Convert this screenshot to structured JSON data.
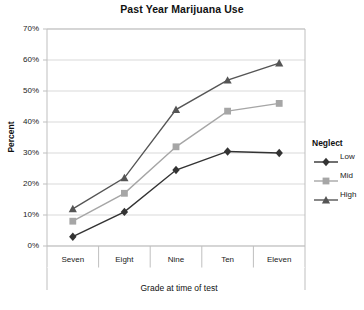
{
  "chart_data": {
    "type": "line",
    "title": "Past Year Marijuana Use",
    "xlabel": "Grade at time of test",
    "ylabel": "Percent",
    "categories": [
      "Seven",
      "Eight",
      "Nine",
      "Ten",
      "Eleven"
    ],
    "ylim": [
      0,
      70
    ],
    "ytick_labels": [
      "0%",
      "10%",
      "20%",
      "30%",
      "40%",
      "50%",
      "60%",
      "70%"
    ],
    "ytick_values": [
      0,
      10,
      20,
      30,
      40,
      50,
      60,
      70
    ],
    "grid": "horizontal",
    "legend_position": "right",
    "legend_title": "Neglect",
    "series": [
      {
        "name": "Low",
        "marker": "diamond",
        "color": "#333333",
        "values": [
          3,
          11,
          24.5,
          30.5,
          30
        ]
      },
      {
        "name": "Mid",
        "marker": "square",
        "color": "#a6a6a6",
        "values": [
          8,
          17,
          32,
          43.5,
          46
        ]
      },
      {
        "name": "High",
        "marker": "triangle",
        "color": "#555555",
        "values": [
          12,
          22,
          44,
          53.5,
          59
        ]
      }
    ]
  },
  "axes": {
    "plot_border_color": "#bfbfbf",
    "gridline_color": "#d9d9d9"
  }
}
